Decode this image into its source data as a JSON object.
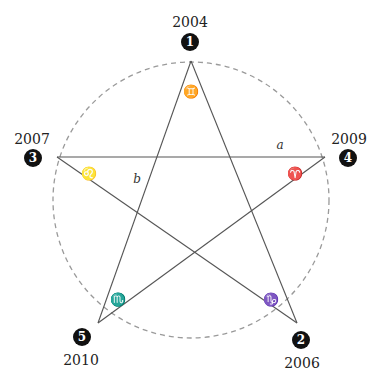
{
  "diagram": {
    "type": "pentagram-in-circle",
    "circle": {
      "cx": 191,
      "cy": 200,
      "r": 138,
      "stroke": "#9a9a9a",
      "dash": "5,4"
    },
    "line_color": "#555555",
    "badge_color": "#111111",
    "vertices": [
      {
        "id": "v1",
        "number": "1",
        "year": "2004",
        "x": 191,
        "y": 61,
        "badge": {
          "x": 190,
          "y": 42
        },
        "year_pos": {
          "x": 190,
          "y": 23
        },
        "symbol": "♊",
        "symbol_name": "gemini",
        "symbol_pos": {
          "x": 191,
          "y": 92
        }
      },
      {
        "id": "v2",
        "number": "2",
        "year": "2006",
        "x": 297,
        "y": 323,
        "badge": {
          "x": 301,
          "y": 340
        },
        "year_pos": {
          "x": 302,
          "y": 364
        },
        "symbol": "♑",
        "symbol_name": "capricorn",
        "symbol_pos": {
          "x": 271,
          "y": 300
        }
      },
      {
        "id": "v3",
        "number": "3",
        "year": "2007",
        "x": 57,
        "y": 157,
        "badge": {
          "x": 33,
          "y": 158
        },
        "year_pos": {
          "x": 32,
          "y": 140
        },
        "symbol": "♌",
        "symbol_name": "leo",
        "symbol_pos": {
          "x": 89,
          "y": 174
        }
      },
      {
        "id": "v4",
        "number": "4",
        "year": "2009",
        "x": 325,
        "y": 157,
        "badge": {
          "x": 348,
          "y": 158
        },
        "year_pos": {
          "x": 349,
          "y": 140
        },
        "symbol": "♈",
        "symbol_name": "aries",
        "symbol_pos": {
          "x": 295,
          "y": 174
        }
      },
      {
        "id": "v5",
        "number": "5",
        "year": "2010",
        "x": 98,
        "y": 323,
        "badge": {
          "x": 82,
          "y": 337
        },
        "year_pos": {
          "x": 81,
          "y": 361
        },
        "symbol": "♏",
        "symbol_name": "scorpio",
        "symbol_pos": {
          "x": 118,
          "y": 300
        }
      }
    ],
    "edges": [
      [
        "v1",
        "v2"
      ],
      [
        "v2",
        "v3"
      ],
      [
        "v3",
        "v4"
      ],
      [
        "v4",
        "v5"
      ],
      [
        "v5",
        "v1"
      ]
    ],
    "labels": [
      {
        "text": "a",
        "x": 280,
        "y": 149
      },
      {
        "text": "b",
        "x": 137,
        "y": 183
      }
    ]
  }
}
